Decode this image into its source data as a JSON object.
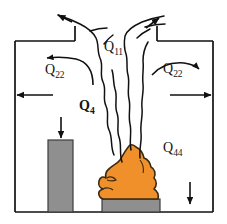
{
  "figure": {
    "type": "schematic-diagram"
  },
  "labels": {
    "plume_flow": {
      "symbol": "Q",
      "subscript": "11",
      "full": "Q11"
    },
    "ceiling_jet_left": {
      "symbol": "Q",
      "subscript": "22",
      "full": "Q22"
    },
    "ceiling_jet_right": {
      "symbol": "Q",
      "subscript": "22",
      "full": "Q22"
    },
    "fire_plume_core": {
      "symbol": "Q",
      "subscript": "4",
      "full": "Q4"
    },
    "compartment_heat": {
      "symbol": "Q",
      "subscript": "44",
      "full": "Q44"
    }
  },
  "colors": {
    "flame": "#F0902A",
    "flame_outline": "#3A2A12",
    "gray_solid": "#8F8F8F",
    "gray_outline": "#3C3C3C",
    "line": "#111111",
    "background": "#FFFFFF"
  },
  "elements": {
    "enclosure": "rectangular compartment with open ceiling vent",
    "column": "gray vertical obstruction at left",
    "fuel_base": "gray horizontal slab beneath flame",
    "flame": "orange fire plume",
    "smoke_plume": "wavy vertical plume rising through ceiling vent"
  },
  "arrows": [
    {
      "name": "top-left-outflow",
      "direction": "up-left"
    },
    {
      "name": "top-right-outflow",
      "direction": "up-right"
    },
    {
      "name": "ceiling-jet-left",
      "direction": "left"
    },
    {
      "name": "ceiling-jet-right",
      "direction": "right"
    },
    {
      "name": "wall-left-outflow",
      "direction": "left"
    },
    {
      "name": "wall-right-outflow",
      "direction": "right"
    },
    {
      "name": "column-downflow",
      "direction": "down"
    },
    {
      "name": "corner-downflow",
      "direction": "down"
    }
  ]
}
